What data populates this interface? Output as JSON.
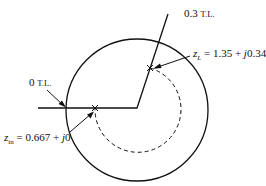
{
  "diagram": {
    "type": "smith-chart-sketch",
    "labels": {
      "wtg_03": {
        "num": "0.3",
        "unit": "T.L."
      },
      "wtg_0": {
        "num": "0",
        "unit": "T.L."
      },
      "zL": {
        "var": "z",
        "sub": "L",
        "eq": " = 1.35 + ",
        "j": "j",
        "val": "0.34"
      },
      "zin": {
        "var": "z",
        "sub": "in",
        "eq": " = 0.667 + ",
        "j": "j",
        "val": "0"
      }
    },
    "points": {
      "zL": {
        "re": 1.35,
        "im": 0.34
      },
      "zin": {
        "re": 0.667,
        "im": 0
      }
    },
    "colors": {
      "stroke": "#111111",
      "background": "#ffffff"
    }
  }
}
